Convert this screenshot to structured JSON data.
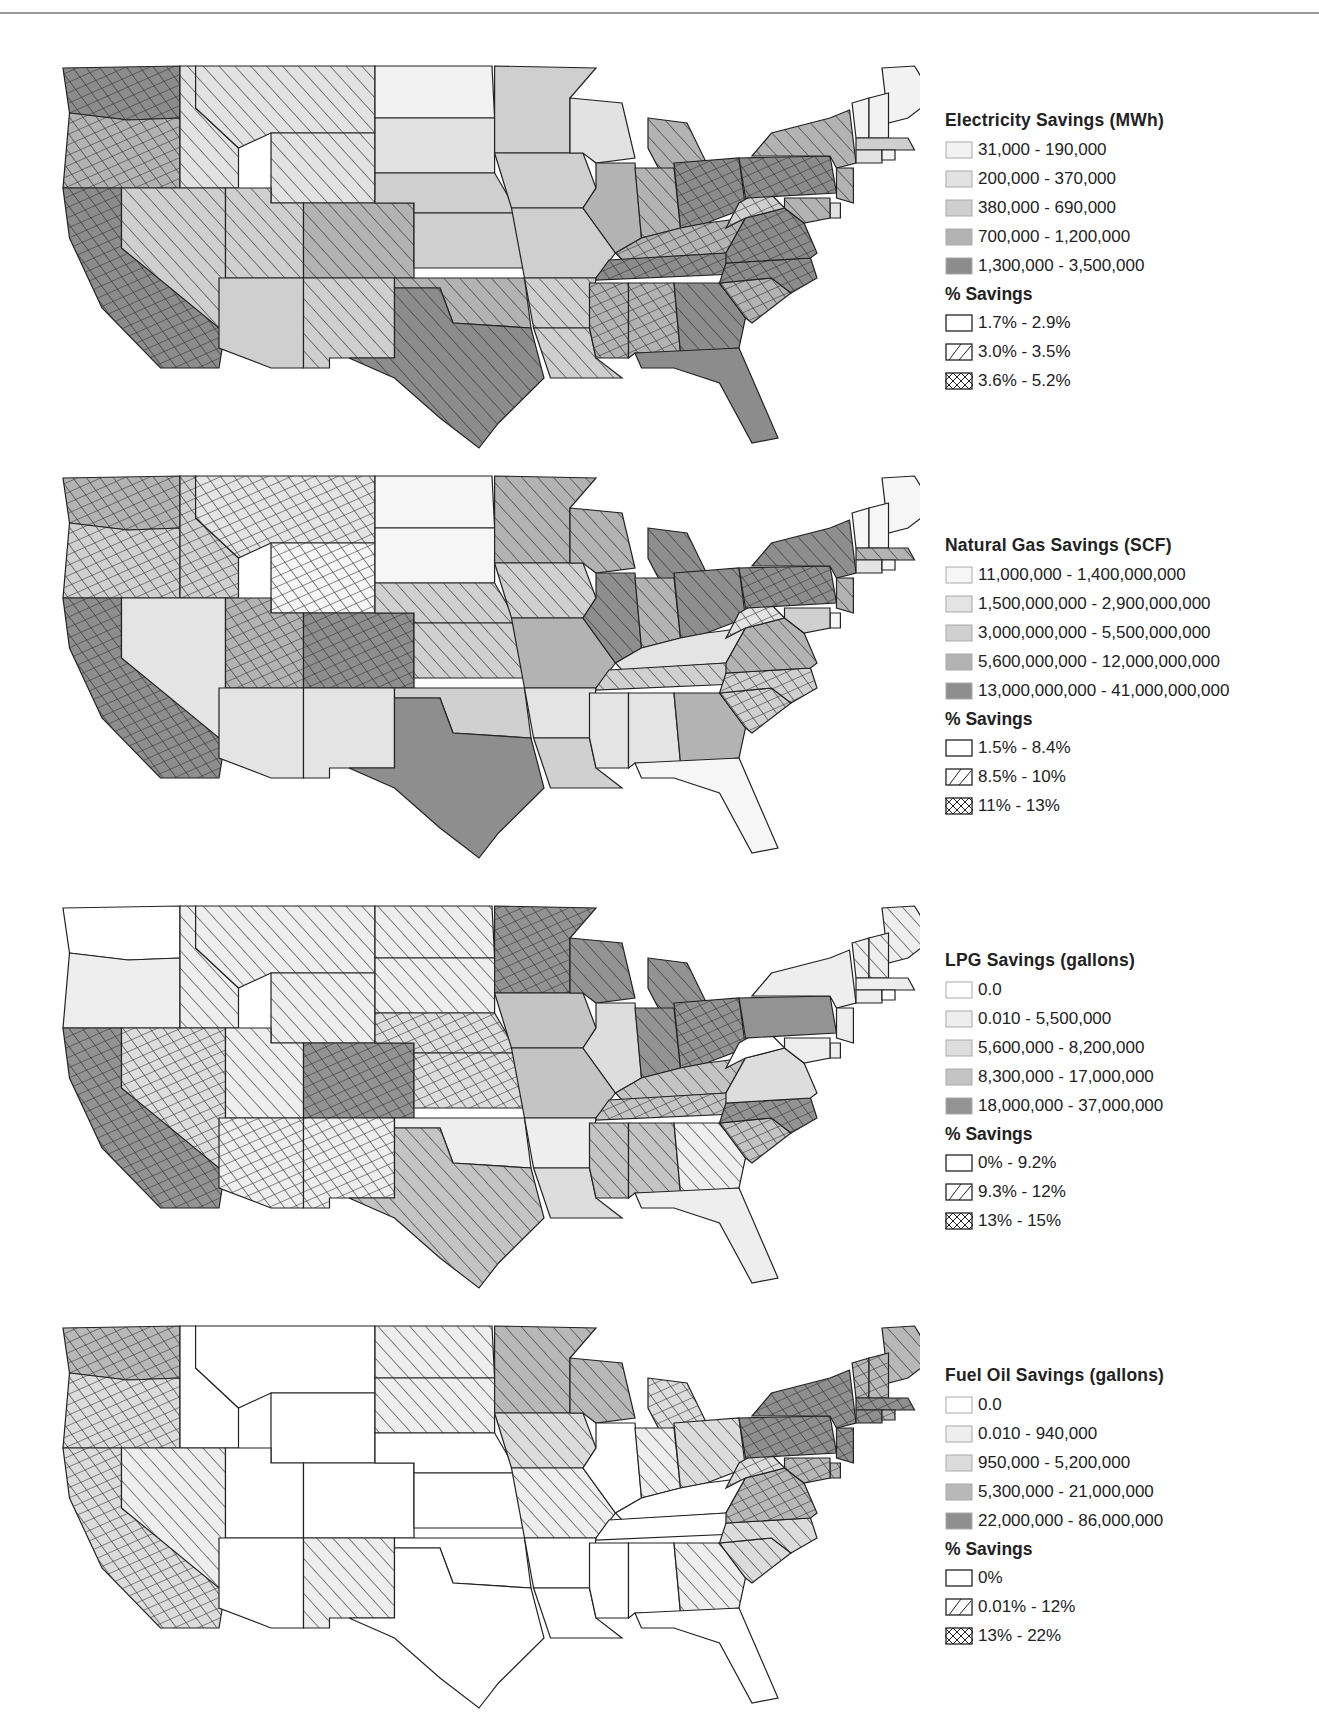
{
  "chart_data": [
    {
      "type": "choropleth",
      "title": "Electricity Savings (MWh)",
      "fill_legend": {
        "title": "Electricity Savings (MWh)",
        "classes": [
          {
            "label": "31,000 - 190,000",
            "color": "#f2f2f2"
          },
          {
            "label": "200,000 - 370,000",
            "color": "#e2e2e2"
          },
          {
            "label": "380,000 - 690,000",
            "color": "#cfcfcf"
          },
          {
            "label": "700,000 - 1,200,000",
            "color": "#b3b3b3"
          },
          {
            "label": "1,300,000 - 3,500,000",
            "color": "#8c8c8c"
          }
        ]
      },
      "pattern_legend": {
        "title": "% Savings",
        "classes": [
          {
            "label": "1.7% - 2.9%",
            "pattern": "none"
          },
          {
            "label": "3.0% - 3.5%",
            "pattern": "hatch"
          },
          {
            "label": "3.6% - 5.2%",
            "pattern": "cross"
          }
        ]
      },
      "states": {
        "WA": [
          4,
          2
        ],
        "OR": [
          3,
          2
        ],
        "CA": [
          4,
          2
        ],
        "ID": [
          1,
          1
        ],
        "MT": [
          1,
          1
        ],
        "WY": [
          1,
          1
        ],
        "NV": [
          2,
          1
        ],
        "UT": [
          2,
          1
        ],
        "CO": [
          3,
          1
        ],
        "AZ": [
          2,
          0
        ],
        "NM": [
          2,
          1
        ],
        "ND": [
          0,
          0
        ],
        "SD": [
          1,
          0
        ],
        "NE": [
          2,
          0
        ],
        "KS": [
          2,
          0
        ],
        "OK": [
          3,
          1
        ],
        "TX": [
          4,
          1
        ],
        "MN": [
          2,
          0
        ],
        "IA": [
          2,
          0
        ],
        "MO": [
          2,
          0
        ],
        "AR": [
          2,
          1
        ],
        "LA": [
          2,
          1
        ],
        "WI": [
          1,
          0
        ],
        "IL": [
          3,
          0
        ],
        "MI": [
          3,
          1
        ],
        "IN": [
          3,
          1
        ],
        "OH": [
          4,
          2
        ],
        "KY": [
          3,
          2
        ],
        "TN": [
          4,
          2
        ],
        "MS": [
          3,
          2
        ],
        "AL": [
          3,
          2
        ],
        "GA": [
          4,
          1
        ],
        "FL": [
          4,
          0
        ],
        "SC": [
          3,
          2
        ],
        "NC": [
          4,
          2
        ],
        "VA": [
          4,
          2
        ],
        "WV": [
          2,
          2
        ],
        "PA": [
          4,
          2
        ],
        "NY": [
          3,
          1
        ],
        "ME": [
          0,
          0
        ],
        "VT": [
          0,
          0
        ],
        "NH": [
          0,
          0
        ],
        "MA": [
          2,
          0
        ],
        "CT": [
          1,
          0
        ],
        "RI": [
          0,
          0
        ],
        "NJ": [
          3,
          1
        ],
        "DE": [
          1,
          0
        ],
        "MD": [
          3,
          1
        ]
      }
    },
    {
      "type": "choropleth",
      "title": "Natural Gas Savings (SCF)",
      "fill_legend": {
        "title": "Natural Gas Savings (SCF)",
        "classes": [
          {
            "label": "11,000,000 - 1,400,000,000",
            "color": "#f6f6f6"
          },
          {
            "label": "1,500,000,000 - 2,900,000,000",
            "color": "#e4e4e4"
          },
          {
            "label": "3,000,000,000 - 5,500,000,000",
            "color": "#d0d0d0"
          },
          {
            "label": "5,600,000,000 - 12,000,000,000",
            "color": "#b3b3b3"
          },
          {
            "label": "13,000,000,000 - 41,000,000,000",
            "color": "#8e8e8e"
          }
        ]
      },
      "pattern_legend": {
        "title": "% Savings",
        "classes": [
          {
            "label": "1.5% - 8.4%",
            "pattern": "none"
          },
          {
            "label": "8.5% - 10%",
            "pattern": "hatch"
          },
          {
            "label": "11% - 13%",
            "pattern": "cross"
          }
        ]
      },
      "states": {
        "WA": [
          3,
          2
        ],
        "OR": [
          2,
          2
        ],
        "CA": [
          4,
          2
        ],
        "ID": [
          2,
          2
        ],
        "MT": [
          1,
          2
        ],
        "WY": [
          0,
          2
        ],
        "NV": [
          1,
          0
        ],
        "UT": [
          3,
          2
        ],
        "CO": [
          4,
          2
        ],
        "AZ": [
          1,
          0
        ],
        "NM": [
          1,
          0
        ],
        "ND": [
          0,
          0
        ],
        "SD": [
          0,
          0
        ],
        "NE": [
          2,
          1
        ],
        "KS": [
          2,
          1
        ],
        "OK": [
          2,
          0
        ],
        "TX": [
          4,
          0
        ],
        "MN": [
          3,
          1
        ],
        "IA": [
          2,
          1
        ],
        "MO": [
          3,
          0
        ],
        "AR": [
          1,
          0
        ],
        "LA": [
          2,
          0
        ],
        "WI": [
          3,
          1
        ],
        "IL": [
          4,
          1
        ],
        "MI": [
          4,
          1
        ],
        "IN": [
          3,
          1
        ],
        "OH": [
          4,
          1
        ],
        "KY": [
          1,
          0
        ],
        "TN": [
          2,
          1
        ],
        "MS": [
          1,
          0
        ],
        "AL": [
          1,
          0
        ],
        "GA": [
          3,
          0
        ],
        "FL": [
          0,
          0
        ],
        "SC": [
          2,
          2
        ],
        "NC": [
          2,
          2
        ],
        "VA": [
          3,
          1
        ],
        "WV": [
          1,
          2
        ],
        "PA": [
          4,
          2
        ],
        "NY": [
          4,
          1
        ],
        "ME": [
          0,
          0
        ],
        "VT": [
          0,
          0
        ],
        "NH": [
          0,
          0
        ],
        "MA": [
          3,
          1
        ],
        "CT": [
          1,
          0
        ],
        "RI": [
          0,
          0
        ],
        "NJ": [
          3,
          1
        ],
        "DE": [
          0,
          0
        ],
        "MD": [
          2,
          0
        ]
      }
    },
    {
      "type": "choropleth",
      "title": "LPG Savings (gallons)",
      "fill_legend": {
        "title": "LPG Savings (gallons)",
        "classes": [
          {
            "label": "0.0",
            "color": "#ffffff"
          },
          {
            "label": "0.010 - 5,500,000",
            "color": "#eeeeee"
          },
          {
            "label": "5,600,000 - 8,200,000",
            "color": "#dddddd"
          },
          {
            "label": "8,300,000 - 17,000,000",
            "color": "#c4c4c4"
          },
          {
            "label": "18,000,000 - 37,000,000",
            "color": "#939393"
          }
        ]
      },
      "pattern_legend": {
        "title": "% Savings",
        "classes": [
          {
            "label": "0% - 9.2%",
            "pattern": "none"
          },
          {
            "label": "9.3% - 12%",
            "pattern": "hatch"
          },
          {
            "label": "13% - 15%",
            "pattern": "cross"
          }
        ]
      },
      "states": {
        "WA": [
          0,
          0
        ],
        "OR": [
          1,
          0
        ],
        "CA": [
          4,
          2
        ],
        "ID": [
          1,
          1
        ],
        "MT": [
          1,
          1
        ],
        "WY": [
          1,
          1
        ],
        "NV": [
          2,
          2
        ],
        "UT": [
          1,
          1
        ],
        "CO": [
          4,
          2
        ],
        "AZ": [
          1,
          2
        ],
        "NM": [
          1,
          2
        ],
        "ND": [
          1,
          1
        ],
        "SD": [
          1,
          1
        ],
        "NE": [
          2,
          2
        ],
        "KS": [
          2,
          2
        ],
        "OK": [
          1,
          0
        ],
        "TX": [
          3,
          1
        ],
        "MN": [
          4,
          2
        ],
        "IA": [
          3,
          0
        ],
        "MO": [
          3,
          0
        ],
        "AR": [
          1,
          0
        ],
        "LA": [
          2,
          0
        ],
        "WI": [
          4,
          1
        ],
        "IL": [
          2,
          0
        ],
        "MI": [
          4,
          1
        ],
        "IN": [
          4,
          1
        ],
        "OH": [
          4,
          2
        ],
        "KY": [
          3,
          1
        ],
        "TN": [
          3,
          2
        ],
        "MS": [
          3,
          1
        ],
        "AL": [
          3,
          1
        ],
        "GA": [
          1,
          1
        ],
        "FL": [
          1,
          0
        ],
        "SC": [
          3,
          2
        ],
        "NC": [
          4,
          2
        ],
        "VA": [
          2,
          0
        ],
        "WV": [
          0,
          0
        ],
        "PA": [
          4,
          0
        ],
        "NY": [
          1,
          0
        ],
        "ME": [
          1,
          1
        ],
        "VT": [
          1,
          1
        ],
        "NH": [
          1,
          1
        ],
        "MA": [
          1,
          0
        ],
        "CT": [
          1,
          0
        ],
        "RI": [
          0,
          0
        ],
        "NJ": [
          1,
          0
        ],
        "DE": [
          1,
          0
        ],
        "MD": [
          1,
          0
        ]
      }
    },
    {
      "type": "choropleth",
      "title": "Fuel Oil Savings (gallons)",
      "fill_legend": {
        "title": "Fuel Oil Savings (gallons)",
        "classes": [
          {
            "label": "0.0",
            "color": "#ffffff"
          },
          {
            "label": "0.010 - 940,000",
            "color": "#eeeeee"
          },
          {
            "label": "950,000 - 5,200,000",
            "color": "#dcdcdc"
          },
          {
            "label": "5,300,000 - 21,000,000",
            "color": "#b8b8b8"
          },
          {
            "label": "22,000,000 - 86,000,000",
            "color": "#8f8f8f"
          }
        ]
      },
      "pattern_legend": {
        "title": "% Savings",
        "classes": [
          {
            "label": "0%",
            "pattern": "none"
          },
          {
            "label": "0.01% - 12%",
            "pattern": "hatch"
          },
          {
            "label": "13% - 22%",
            "pattern": "cross"
          }
        ]
      },
      "states": {
        "WA": [
          3,
          2
        ],
        "OR": [
          2,
          2
        ],
        "CA": [
          2,
          2
        ],
        "ID": [
          0,
          0
        ],
        "MT": [
          0,
          0
        ],
        "WY": [
          0,
          0
        ],
        "NV": [
          1,
          1
        ],
        "UT": [
          0,
          0
        ],
        "CO": [
          0,
          0
        ],
        "AZ": [
          0,
          0
        ],
        "NM": [
          1,
          1
        ],
        "ND": [
          1,
          1
        ],
        "SD": [
          1,
          1
        ],
        "NE": [
          0,
          0
        ],
        "KS": [
          0,
          0
        ],
        "OK": [
          0,
          0
        ],
        "TX": [
          0,
          0
        ],
        "MN": [
          3,
          1
        ],
        "IA": [
          2,
          1
        ],
        "MO": [
          1,
          1
        ],
        "AR": [
          0,
          0
        ],
        "LA": [
          0,
          0
        ],
        "WI": [
          3,
          1
        ],
        "IL": [
          0,
          0
        ],
        "MI": [
          2,
          2
        ],
        "IN": [
          1,
          1
        ],
        "OH": [
          2,
          1
        ],
        "KY": [
          0,
          0
        ],
        "TN": [
          0,
          0
        ],
        "MS": [
          0,
          0
        ],
        "AL": [
          0,
          0
        ],
        "GA": [
          1,
          1
        ],
        "FL": [
          0,
          0
        ],
        "SC": [
          2,
          1
        ],
        "NC": [
          2,
          1
        ],
        "VA": [
          3,
          2
        ],
        "WV": [
          2,
          2
        ],
        "PA": [
          4,
          2
        ],
        "NY": [
          4,
          2
        ],
        "ME": [
          3,
          1
        ],
        "VT": [
          3,
          2
        ],
        "NH": [
          3,
          2
        ],
        "MA": [
          4,
          2
        ],
        "CT": [
          4,
          2
        ],
        "RI": [
          3,
          2
        ],
        "NJ": [
          4,
          2
        ],
        "DE": [
          3,
          2
        ],
        "MD": [
          3,
          2
        ]
      }
    }
  ]
}
